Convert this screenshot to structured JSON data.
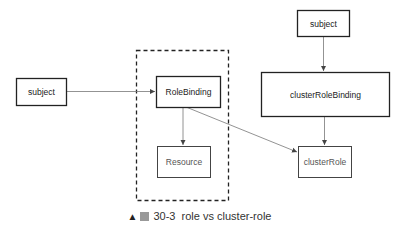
{
  "diagram": {
    "container": {
      "label": "",
      "style": "dashed"
    },
    "nodes": {
      "subject_left": {
        "label": "subject"
      },
      "role_binding": {
        "label": "RoleBinding"
      },
      "resource": {
        "label": "Resource"
      },
      "subject_right": {
        "label": "subject"
      },
      "cluster_role_binding": {
        "label": "clusterRoleBinding"
      },
      "cluster_role": {
        "label": "clusterRole"
      }
    },
    "edges": [
      {
        "from": "subject_left",
        "to": "role_binding"
      },
      {
        "from": "role_binding",
        "to": "resource"
      },
      {
        "from": "role_binding",
        "to": "cluster_role"
      },
      {
        "from": "subject_right",
        "to": "cluster_role_binding"
      },
      {
        "from": "cluster_role_binding",
        "to": "cluster_role"
      }
    ]
  },
  "caption": {
    "marker_icon": "triangle-up-icon",
    "figure_icon": "figure-glyph-icon",
    "number": "30-3",
    "text": "role vs cluster-role"
  }
}
